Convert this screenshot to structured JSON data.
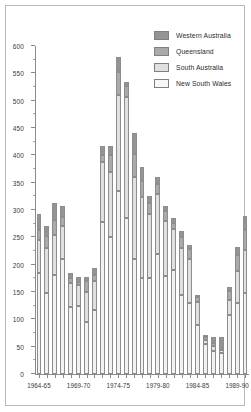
{
  "chart_data": {
    "type": "bar",
    "subtype": "stacked-vertical",
    "title": "",
    "xlabel": "",
    "ylabel": "",
    "ylim": [
      0,
      600
    ],
    "ytick_step": 50,
    "yticks": [
      0,
      50,
      100,
      150,
      200,
      250,
      300,
      350,
      400,
      450,
      500,
      550,
      600
    ],
    "ytick_labels": [
      "0",
      "50",
      "100",
      "150",
      "200",
      "250",
      "300",
      "350",
      "400",
      "450",
      "500",
      "550",
      "600"
    ],
    "minor_ytick_step": 25,
    "grid": false,
    "legend_position": "top-right",
    "categories": [
      "1964-65",
      "1965-66",
      "1966-67",
      "1967-68",
      "1968-69",
      "1969-70",
      "1970-71",
      "1971-72",
      "1972-73",
      "1973-74",
      "1974-75",
      "1975-76",
      "1976-77",
      "1977-78",
      "1978-79",
      "1979-80",
      "1980-81",
      "1981-82",
      "1982-83",
      "1983-84",
      "1984-85",
      "1985-86",
      "1986-87",
      "1987-88",
      "1988-89",
      "1989-90",
      "1990-91"
    ],
    "xtick_labels": [
      "1964-65",
      "1969-70",
      "1974-75",
      "1979-80",
      "1984-85",
      "1989-90"
    ],
    "xtick_indices": [
      0,
      5,
      10,
      15,
      20,
      25
    ],
    "series": [
      {
        "name": "New South Wales",
        "color": "#f2f2f2",
        "values": [
          185,
          148,
          182,
          210,
          122,
          125,
          95,
          118,
          278,
          250,
          335,
          285,
          210,
          175,
          175,
          220,
          180,
          190,
          145,
          130,
          90,
          55,
          42,
          38,
          108,
          130,
          148
        ]
      },
      {
        "name": "South Australia",
        "color": "#e0e0e0",
        "values": [
          60,
          82,
          72,
          60,
          45,
          38,
          55,
          52,
          110,
          120,
          175,
          222,
          150,
          148,
          118,
          110,
          100,
          75,
          85,
          80,
          42,
          8,
          10,
          6,
          28,
          58,
          78
        ]
      },
      {
        "name": "Queensland",
        "color": "#aaaaaa",
        "values": [
          18,
          22,
          28,
          18,
          8,
          5,
          20,
          12,
          12,
          30,
          42,
          20,
          42,
          30,
          20,
          18,
          18,
          12,
          20,
          18,
          8,
          4,
          5,
          4,
          15,
          30,
          38
        ]
      },
      {
        "name": "Western Australia",
        "color": "#949494",
        "values": [
          30,
          18,
          30,
          20,
          10,
          10,
          8,
          12,
          18,
          18,
          28,
          8,
          38,
          25,
          12,
          12,
          10,
          8,
          12,
          8,
          5,
          5,
          10,
          20,
          8,
          15,
          25
        ]
      }
    ],
    "totals": [
      293,
      270,
      312,
      308,
      185,
      178,
      178,
      194,
      418,
      418,
      580,
      535,
      440,
      378,
      325,
      360,
      308,
      285,
      262,
      236,
      145,
      72,
      67,
      68,
      159,
      233,
      289
    ]
  },
  "legend": {
    "entries": [
      {
        "label": "Western Australia",
        "color": "#949494"
      },
      {
        "label": "Queensland",
        "color": "#aaaaaa"
      },
      {
        "label": "South Australia",
        "color": "#e0e0e0"
      },
      {
        "label": "New South Wales",
        "color": "#f7f7f7"
      }
    ]
  }
}
